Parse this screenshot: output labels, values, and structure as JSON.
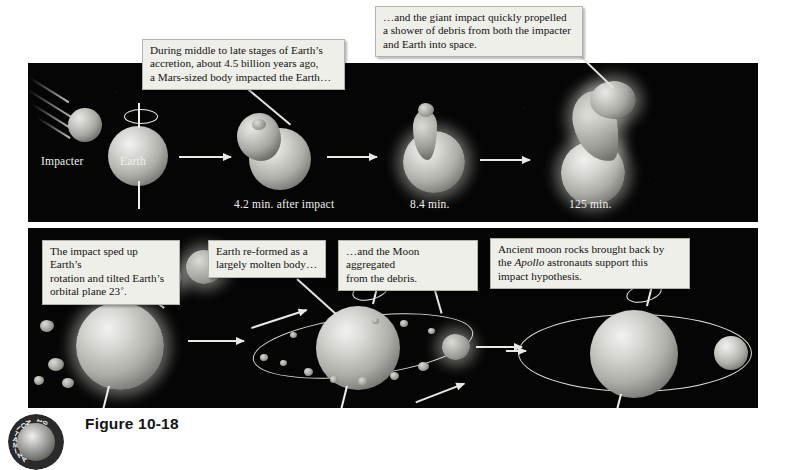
{
  "figure": {
    "caption": "Figure 10-18",
    "badge_text": "ANIMATION 10"
  },
  "colors": {
    "space": "#050505",
    "callout_bg": "#efefea",
    "callout_border": "#b4b4ae",
    "label_text": "#f0f0ec",
    "caption_text": "#141414"
  },
  "top_row": {
    "labels": [
      {
        "id": "impacter",
        "text": "Impacter"
      },
      {
        "id": "earth",
        "text": "Earth"
      },
      {
        "id": "t1",
        "text": "4.2 min. after impact"
      },
      {
        "id": "t2",
        "text": "8.4 min."
      },
      {
        "id": "t3",
        "text": "125 min."
      }
    ],
    "callouts": [
      {
        "id": "callout-accretion",
        "lines": [
          "During middle to late stages of Earth’s",
          "accretion, about 4.5 billion years ago,",
          "a Mars-sized body impacted the Earth…"
        ]
      },
      {
        "id": "callout-debris",
        "lines": [
          "…and the giant impact quickly propelled",
          "a shower of debris from both the impacter",
          "and Earth into space."
        ]
      }
    ]
  },
  "bottom_row": {
    "callouts": [
      {
        "id": "callout-rotation",
        "lines": [
          "The impact sped up Earth’s",
          "rotation and tilted Earth’s",
          "orbital plane 23˚."
        ]
      },
      {
        "id": "callout-molten",
        "lines": [
          "Earth re-formed as a",
          "largely molten body…"
        ]
      },
      {
        "id": "callout-moon",
        "lines": [
          "…and the Moon aggregated",
          "from the debris."
        ]
      },
      {
        "id": "callout-apollo",
        "lines_rich": [
          [
            {
              "t": "Ancient moon rocks brought back by",
              "i": false
            }
          ],
          [
            {
              "t": "the ",
              "i": false
            },
            {
              "t": "Apollo",
              "i": true
            },
            {
              "t": " astronauts support this",
              "i": false
            }
          ],
          [
            {
              "t": "impact hypothesis.",
              "i": false
            }
          ]
        ]
      }
    ]
  }
}
